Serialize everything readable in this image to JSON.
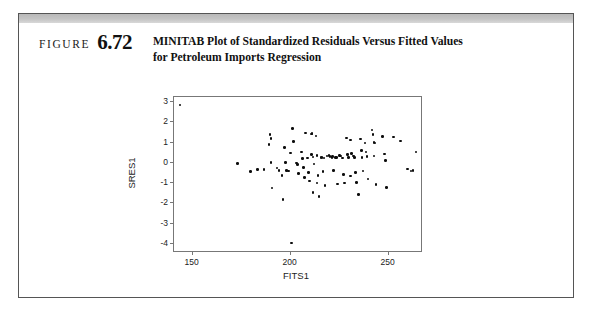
{
  "figure": {
    "label_word": "FIGURE",
    "number": "6.72",
    "caption_line1": "MINITAB Plot of Standardized Residuals Versus Fitted Values",
    "caption_line2": "for Petroleum Imports Regression",
    "border_color": "#555555",
    "band_color": "#c4c4c4"
  },
  "chart_data": {
    "type": "scatter",
    "title": "MINITAB Plot of Standardized Residuals Versus Fitted Values for Petroleum Imports Regression",
    "xlabel": "FITS1",
    "ylabel": "SRES1",
    "xlim": [
      141,
      267
    ],
    "ylim": [
      -4.4,
      3.2
    ],
    "xticks": [
      150,
      200,
      250
    ],
    "yticks": [
      3,
      2,
      1,
      0,
      -1,
      -2,
      -3,
      -4
    ],
    "grid": false,
    "legend": null,
    "marker_color": "#0d0d0d",
    "points": [
      [
        144.0,
        2.8
      ],
      [
        173.5,
        -0.07
      ],
      [
        180.0,
        -0.47
      ],
      [
        183.5,
        -0.37
      ],
      [
        187.0,
        -0.38
      ],
      [
        190.0,
        1.35
      ],
      [
        190.5,
        1.16
      ],
      [
        189.5,
        0.85
      ],
      [
        190.5,
        -0.02
      ],
      [
        191.0,
        -1.3
      ],
      [
        193.5,
        -0.3
      ],
      [
        194.5,
        -0.43
      ],
      [
        196.0,
        -0.68
      ],
      [
        196.5,
        -1.87
      ],
      [
        197.5,
        0.72
      ],
      [
        198.0,
        -0.02
      ],
      [
        198.5,
        -0.42
      ],
      [
        199.5,
        -0.45
      ],
      [
        200.5,
        0.43
      ],
      [
        201.5,
        1.65
      ],
      [
        202.0,
        1.0
      ],
      [
        201.0,
        -4.0
      ],
      [
        203.5,
        -0.05
      ],
      [
        204.0,
        -0.12
      ],
      [
        204.5,
        -0.58
      ],
      [
        206.0,
        0.48
      ],
      [
        206.5,
        0.16
      ],
      [
        207.0,
        -0.28
      ],
      [
        207.5,
        -0.77
      ],
      [
        208.0,
        1.43
      ],
      [
        209.0,
        0.18
      ],
      [
        209.5,
        -0.52
      ],
      [
        210.0,
        -0.95
      ],
      [
        211.0,
        1.38
      ],
      [
        211.5,
        1.4
      ],
      [
        211.0,
        0.35
      ],
      [
        212.0,
        0.24
      ],
      [
        212.5,
        -0.1
      ],
      [
        212.0,
        -1.52
      ],
      [
        213.5,
        1.27
      ],
      [
        214.0,
        0.3
      ],
      [
        214.5,
        -0.68
      ],
      [
        214.0,
        -1.05
      ],
      [
        215.0,
        -1.72
      ],
      [
        216.0,
        0.2
      ],
      [
        216.5,
        0.22
      ],
      [
        217.5,
        0.18
      ],
      [
        217.0,
        -0.48
      ],
      [
        218.0,
        -1.18
      ],
      [
        219.0,
        0.28
      ],
      [
        220.0,
        0.3
      ],
      [
        220.5,
        0.25
      ],
      [
        221.5,
        0.2
      ],
      [
        222.0,
        0.26
      ],
      [
        222.5,
        -0.42
      ],
      [
        223.5,
        0.22
      ],
      [
        224.0,
        0.2
      ],
      [
        224.5,
        -1.1
      ],
      [
        225.5,
        0.3
      ],
      [
        226.0,
        0.28
      ],
      [
        227.0,
        0.18
      ],
      [
        227.5,
        -0.62
      ],
      [
        228.0,
        -1.05
      ],
      [
        229.0,
        1.18
      ],
      [
        229.5,
        0.35
      ],
      [
        230.0,
        0.22
      ],
      [
        231.0,
        1.08
      ],
      [
        231.5,
        0.4
      ],
      [
        231.0,
        -0.7
      ],
      [
        232.5,
        0.28
      ],
      [
        233.0,
        0.2
      ],
      [
        233.5,
        -0.52
      ],
      [
        234.0,
        -1.02
      ],
      [
        235.0,
        -1.6
      ],
      [
        236.0,
        1.12
      ],
      [
        236.5,
        0.55
      ],
      [
        237.0,
        0.22
      ],
      [
        237.5,
        -0.45
      ],
      [
        238.5,
        0.92
      ],
      [
        239.0,
        0.48
      ],
      [
        239.5,
        0.25
      ],
      [
        240.0,
        -0.85
      ],
      [
        242.0,
        1.58
      ],
      [
        242.5,
        1.35
      ],
      [
        243.0,
        0.95
      ],
      [
        243.5,
        0.92
      ],
      [
        243.0,
        0.28
      ],
      [
        244.0,
        -1.12
      ],
      [
        247.5,
        1.25
      ],
      [
        248.5,
        0.38
      ],
      [
        249.0,
        0.08
      ],
      [
        249.5,
        -1.28
      ],
      [
        253.0,
        1.22
      ],
      [
        256.5,
        1.02
      ],
      [
        260.0,
        -0.35
      ],
      [
        262.0,
        -0.45
      ],
      [
        263.0,
        -0.42
      ],
      [
        264.5,
        0.48
      ]
    ]
  }
}
